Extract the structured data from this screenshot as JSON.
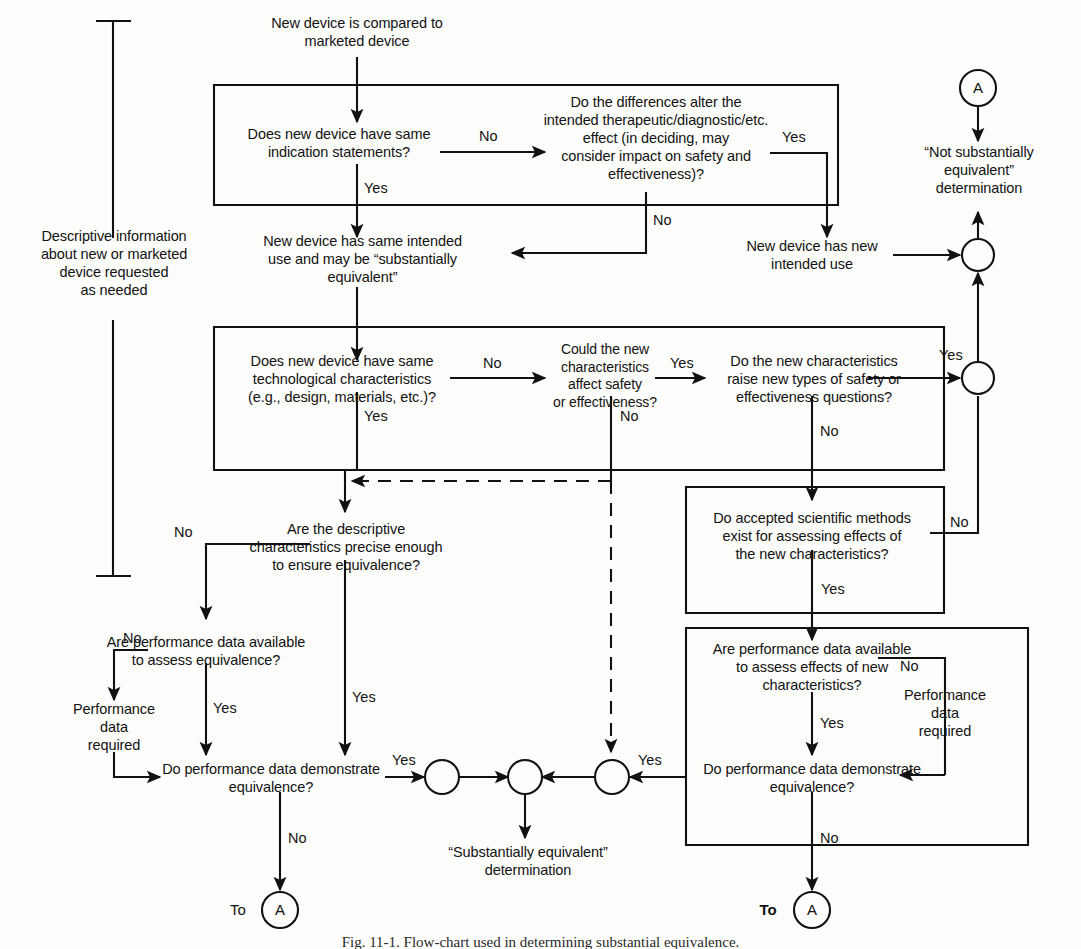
{
  "figure": {
    "caption": "Fig. 11-1.  Flow-chart used in determining substantial equivalence.",
    "ink_color": "#111111",
    "background_color": "#fdfdfc"
  },
  "nodes": {
    "start": "New device is compared to\nmarketed device",
    "q_indication": "Does new device have same\nindication statements?",
    "q_differences": "Do the differences alter the\nintended therapeutic/diagnostic/etc.\neffect (in deciding, may\nconsider impact on safety and\neffectiveness)?",
    "same_intended_use": "New device has same intended\nuse and may be “substantially\nequivalent”",
    "new_intended_use": "New device has new\nintended use",
    "not_substantially_equivalent": "“Not substantially\nequivalent”\ndetermination",
    "q_tech_characteristics": "Does new device have same\ntechnological characteristics\n(e.g., design, materials, etc.)?",
    "q_could_affect": "Could the new\ncharacteristics\naffect safety\nor effectiveness?",
    "q_raise_new_types": "Do the new characteristics\nraise new types of safety or\neffectiveness questions?",
    "q_accepted_methods": "Do accepted scientific methods\nexist for assessing effects of\nthe new characteristics?",
    "q_descriptive_precise": "Are the descriptive\ncharacteristics precise enough\nto ensure equivalence?",
    "q_perf_data_available_left": "Are performance data available\nto assess equivalence?",
    "q_perf_data_available_right": "Are performance data available\nto assess effects of new\ncharacteristics?",
    "perf_data_required_left": "Performance\ndata\nrequired",
    "perf_data_required_right": "Performance\ndata\nrequired",
    "q_demonstrate_left": "Do performance data demonstrate\nequivalence?",
    "q_demonstrate_right": "Do performance data demonstrate\nequivalence?",
    "substantially_equivalent": "“Substantially equivalent”\ndetermination",
    "descriptive_info": "Descriptive information\nabout new or marketed\ndevice requested\nas needed"
  },
  "connectors": {
    "a_top": "A",
    "a_bottom_left": "A",
    "a_bottom_right": "A",
    "to_left": "To",
    "to_right": "To"
  },
  "edge_labels": {
    "indication_no": "No",
    "indication_yes": "Yes",
    "differences_no": "No",
    "differences_yes": "Yes",
    "tech_no": "No",
    "tech_yes": "Yes",
    "could_affect_yes": "Yes",
    "could_affect_no": "No",
    "raise_types_yes": "Yes",
    "raise_types_no": "No",
    "methods_no": "No",
    "methods_yes": "Yes",
    "descriptive_no": "No",
    "descriptive_yes": "Yes",
    "perf_avail_left_no": "No",
    "perf_avail_left_yes": "Yes",
    "perf_avail_right_no": "No",
    "perf_avail_right_yes": "Yes",
    "demo_left_yes": "Yes",
    "demo_left_no": "No",
    "demo_right_yes": "Yes",
    "demo_right_no": "No"
  }
}
